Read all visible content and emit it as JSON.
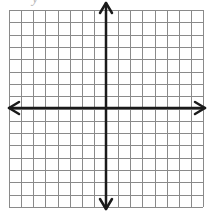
{
  "figure": {
    "type": "coordinate-plane",
    "axis_label_partial": "y",
    "grid": {
      "columns": 16,
      "rows": 16,
      "left": 9,
      "top": 10,
      "right": 203,
      "bottom": 207,
      "line_color": "#8a8a8a"
    },
    "axes": {
      "origin_x": 106,
      "origin_y": 108,
      "color": "#1a1a1a",
      "arrows": [
        "up",
        "down",
        "left",
        "right"
      ]
    }
  }
}
